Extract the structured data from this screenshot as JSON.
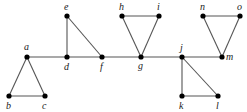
{
  "diagram": {
    "type": "graph",
    "colors": {
      "edge": "#555555",
      "node": "#000000",
      "label": "#222222",
      "background": "#ffffff"
    },
    "nodes": [
      {
        "id": "a",
        "label": "a",
        "x": 27,
        "y": 57,
        "lx": 24,
        "ly": 50
      },
      {
        "id": "b",
        "label": "b",
        "x": 9,
        "y": 96,
        "lx": 6,
        "ly": 109
      },
      {
        "id": "c",
        "label": "c",
        "x": 45,
        "y": 96,
        "lx": 42,
        "ly": 109
      },
      {
        "id": "d",
        "label": "d",
        "x": 67,
        "y": 57,
        "lx": 64,
        "ly": 70
      },
      {
        "id": "e",
        "label": "e",
        "x": 67,
        "y": 16,
        "lx": 64,
        "ly": 10
      },
      {
        "id": "f",
        "label": "f",
        "x": 102,
        "y": 57,
        "lx": 100,
        "ly": 70
      },
      {
        "id": "g",
        "label": "g",
        "x": 141,
        "y": 57,
        "lx": 138,
        "ly": 69
      },
      {
        "id": "h",
        "label": "h",
        "x": 122,
        "y": 16,
        "lx": 119,
        "ly": 10
      },
      {
        "id": "i",
        "label": "i",
        "x": 159,
        "y": 16,
        "lx": 157,
        "ly": 10
      },
      {
        "id": "j",
        "label": "j",
        "x": 182,
        "y": 57,
        "lx": 180,
        "ly": 51
      },
      {
        "id": "k",
        "label": "k",
        "x": 182,
        "y": 96,
        "lx": 179,
        "ly": 109
      },
      {
        "id": "l",
        "label": "l",
        "x": 218,
        "y": 96,
        "lx": 216,
        "ly": 109
      },
      {
        "id": "m",
        "label": "m",
        "x": 222,
        "y": 57,
        "lx": 226,
        "ly": 60
      },
      {
        "id": "n",
        "label": "n",
        "x": 203,
        "y": 16,
        "lx": 200,
        "ly": 10
      },
      {
        "id": "o",
        "label": "o",
        "x": 240,
        "y": 16,
        "lx": 237,
        "ly": 10
      }
    ],
    "edges": [
      [
        "a",
        "b"
      ],
      [
        "a",
        "c"
      ],
      [
        "b",
        "c"
      ],
      [
        "a",
        "d"
      ],
      [
        "d",
        "f"
      ],
      [
        "f",
        "g"
      ],
      [
        "g",
        "j"
      ],
      [
        "j",
        "m"
      ],
      [
        "d",
        "e"
      ],
      [
        "e",
        "f"
      ],
      [
        "g",
        "h"
      ],
      [
        "g",
        "i"
      ],
      [
        "h",
        "i"
      ],
      [
        "j",
        "k"
      ],
      [
        "j",
        "l"
      ],
      [
        "k",
        "l"
      ],
      [
        "m",
        "n"
      ],
      [
        "m",
        "o"
      ],
      [
        "n",
        "o"
      ]
    ]
  }
}
